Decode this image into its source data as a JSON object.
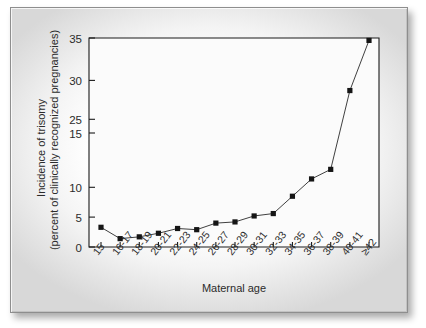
{
  "figure": {
    "name": "incidence-of-trisomy-vs-maternal-age",
    "frame_border_color": "#8e8e8e",
    "page_background": "#ffffff"
  },
  "chart_data": {
    "type": "line",
    "title": "",
    "subtitle": "",
    "xlabel": "Maternal age",
    "ylabel_line1": "Incidence of trisomy",
    "ylabel_line2": "(percent of clinically recognized pregnancies)",
    "categories": [
      "15",
      "16-17",
      "18-19",
      "20-21",
      "22-23",
      "24-25",
      "26-27",
      "28-29",
      "30-31",
      "32-33",
      "34-35",
      "36-37",
      "38-39",
      "40-41",
      "≥42"
    ],
    "series": [
      {
        "name": "Incidence of trisomy",
        "values": [
          3.3,
          1.4,
          1.7,
          2.3,
          3.1,
          2.9,
          4.0,
          4.2,
          5.2,
          5.6,
          8.5,
          11.4,
          13.0,
          26.2,
          34.6
        ]
      }
    ],
    "ylim": [
      0,
      35
    ],
    "y_ticks": [
      0,
      5,
      10,
      15,
      25,
      30,
      35
    ],
    "y_tick_labels": [
      "0",
      "5",
      "10",
      "15",
      "25",
      "30",
      "35"
    ],
    "grid": false,
    "legend": false,
    "legend_position": "none",
    "marker": "square",
    "marker_color": "#151515",
    "line_color": "#2a2a2a",
    "axis_color": "#1b1b1b",
    "plot_background": "#fbfbfb",
    "x_tick_label_rotation": -52
  }
}
